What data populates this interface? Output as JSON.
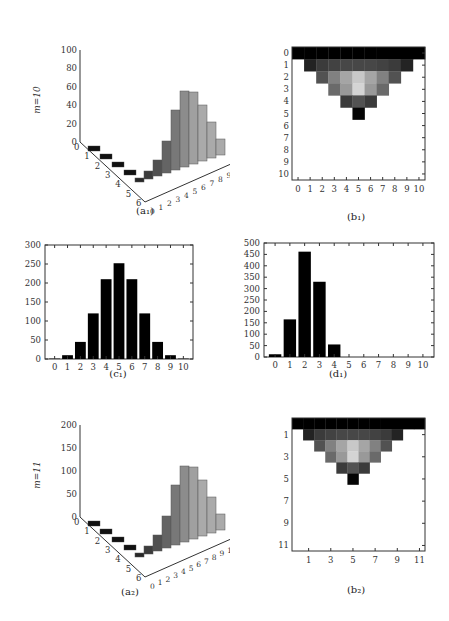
{
  "chart_data": [
    {
      "id": "a1",
      "type": "bar3d",
      "caption": "(a₁)",
      "zlabel": "m=10",
      "zticks": [
        0,
        20,
        40,
        60,
        80,
        100
      ],
      "xticks": [
        0,
        1,
        2,
        3,
        4,
        5,
        6
      ],
      "yticks": [
        0,
        1,
        2,
        3,
        4,
        5,
        6,
        7,
        8,
        9,
        10
      ]
    },
    {
      "id": "b1",
      "type": "heatmap",
      "caption": "(b₁)",
      "xticks": [
        0,
        1,
        2,
        3,
        4,
        5,
        6,
        7,
        8,
        9,
        10
      ],
      "yticks": [
        0,
        1,
        2,
        3,
        4,
        5,
        6,
        7,
        8,
        9,
        10
      ],
      "rows": [
        [
          0,
          0,
          0,
          0,
          0,
          0,
          0,
          0,
          0,
          0,
          0,
          0
        ],
        [
          null,
          0.15,
          0.25,
          0.28,
          0.3,
          0.3,
          0.3,
          0.28,
          0.25,
          0.15,
          null,
          null
        ],
        [
          null,
          null,
          0.35,
          0.55,
          0.7,
          0.85,
          0.7,
          0.55,
          0.35,
          null,
          null,
          null
        ],
        [
          null,
          null,
          null,
          0.45,
          0.65,
          0.9,
          0.65,
          0.45,
          null,
          null,
          null,
          null
        ],
        [
          null,
          null,
          null,
          null,
          0.25,
          0.35,
          0.25,
          null,
          null,
          null,
          null,
          null
        ],
        [
          null,
          null,
          null,
          null,
          null,
          0.02,
          null,
          null,
          null,
          null,
          null,
          null
        ]
      ]
    },
    {
      "id": "c1",
      "type": "bar",
      "caption": "(c₁)",
      "categories": [
        "0",
        "1",
        "2",
        "3",
        "4",
        "5",
        "6",
        "7",
        "8",
        "9",
        "10"
      ],
      "values": [
        1,
        10,
        45,
        120,
        210,
        252,
        210,
        120,
        45,
        10,
        1
      ],
      "ylim": [
        0,
        300
      ],
      "yticks": [
        0,
        50,
        100,
        150,
        200,
        250,
        300
      ]
    },
    {
      "id": "d1",
      "type": "bar",
      "caption": "(d₁)",
      "categories": [
        "0",
        "1",
        "2",
        "3",
        "4",
        "5",
        "6",
        "7",
        "8",
        "9",
        "10"
      ],
      "values": [
        12,
        165,
        462,
        330,
        55,
        0,
        0,
        0,
        0,
        0,
        0
      ],
      "ylim": [
        0,
        500
      ],
      "yticks": [
        0,
        50,
        100,
        150,
        200,
        250,
        300,
        350,
        400,
        450,
        500
      ]
    },
    {
      "id": "a2",
      "type": "bar3d",
      "caption": "(a₂)",
      "zlabel": "m=11",
      "zticks": [
        0,
        50,
        100,
        150,
        200
      ],
      "xticks": [
        0,
        1,
        2,
        3,
        4,
        5,
        6
      ],
      "yticks": [
        0,
        1,
        2,
        3,
        4,
        5,
        6,
        7,
        8,
        9,
        10,
        11
      ]
    },
    {
      "id": "b2",
      "type": "heatmap",
      "caption": "(b₂)",
      "xticks": [
        1,
        3,
        5,
        7,
        9,
        11
      ],
      "yticks": [
        1,
        3,
        5,
        7,
        9,
        11
      ]
    }
  ]
}
